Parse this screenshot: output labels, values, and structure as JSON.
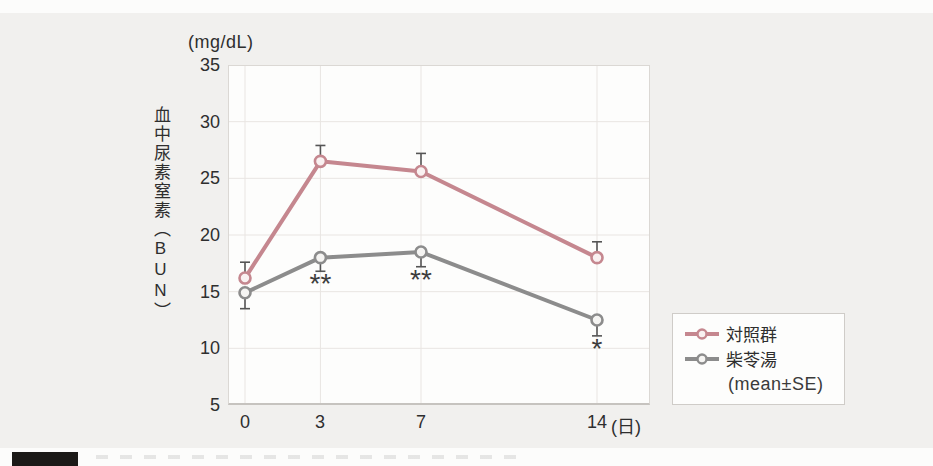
{
  "figure": {
    "y_unit_label": "(mg/dL)",
    "y_axis_title": "血中尿素窒素（BUN）",
    "x_unit_label": "(日)"
  },
  "chart_data": {
    "type": "line",
    "x": [
      0,
      3,
      7,
      14
    ],
    "x_tick_labels": [
      "0",
      "3",
      "7",
      "14"
    ],
    "x_unit": "(日)",
    "xlabel": "日 (days)",
    "ylabel": "血中尿素窒素（BUN）",
    "y_unit": "(mg/dL)",
    "ylim": [
      5,
      35
    ],
    "y_ticks": [
      35,
      30,
      25,
      20,
      15,
      10,
      5
    ],
    "y_tick_labels": [
      "35",
      "30",
      "25",
      "20",
      "15",
      "10",
      "5"
    ],
    "grid": true,
    "error_bar_color": "#555555",
    "series": [
      {
        "name": "対照群",
        "color": "#c5878f",
        "marker_fill": "#f9f1f1",
        "values": [
          16.2,
          26.5,
          25.6,
          18.0
        ],
        "se": [
          1.4,
          1.4,
          1.6,
          1.4
        ],
        "error_dir": "up"
      },
      {
        "name": "柴苓湯",
        "color": "#8c8c8c",
        "marker_fill": "#f5f4f2",
        "values": [
          14.9,
          18.0,
          18.5,
          12.5
        ],
        "se": [
          1.4,
          1.2,
          1.3,
          1.4
        ],
        "error_dir": "down"
      }
    ],
    "annotations": [
      {
        "day": 3,
        "series": 1,
        "text": "**"
      },
      {
        "day": 7,
        "series": 1,
        "text": "**"
      },
      {
        "day": 14,
        "series": 1,
        "text": "*"
      }
    ],
    "legend": {
      "note": "(mean±SE)",
      "position": "right-bottom"
    }
  }
}
